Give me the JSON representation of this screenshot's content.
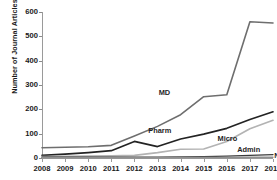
{
  "chart_data": {
    "type": "line",
    "title": "",
    "xlabel": "",
    "ylabel": "Number of Journal Articles",
    "categories": [
      "2008",
      "2009",
      "2010",
      "2011",
      "2012",
      "2013",
      "2014",
      "2015",
      "2016",
      "2017",
      "2018"
    ],
    "x": [
      2008,
      2009,
      2010,
      2011,
      2012,
      2013,
      2014,
      2015,
      2016,
      2017,
      2018
    ],
    "ylim": [
      0,
      600
    ],
    "yticks": [
      0,
      100,
      200,
      300,
      400,
      500,
      600
    ],
    "ytick_labels": [
      "0",
      "100",
      "200",
      "300",
      "400",
      "500",
      "600"
    ],
    "grid": false,
    "legend_position": "inline-labels",
    "series": [
      {
        "name": "MD",
        "color": "#6e6e6e",
        "width": 1.6,
        "values": [
          42,
          44,
          46,
          52,
          90,
          130,
          178,
          252,
          260,
          560,
          555
        ]
      },
      {
        "name": "Pharm",
        "color": "#232323",
        "width": 1.7,
        "values": [
          11,
          16,
          22,
          30,
          68,
          47,
          78,
          98,
          122,
          158,
          190
        ]
      },
      {
        "name": "Micro",
        "color": "#b3b3b3",
        "width": 1.7,
        "values": [
          6,
          7,
          8,
          9,
          11,
          22,
          36,
          37,
          68,
          120,
          155
        ]
      },
      {
        "name": "Admin",
        "color": "#3a3a3a",
        "width": 1.3,
        "values": [
          3,
          3,
          3,
          3,
          4,
          4,
          5,
          6,
          8,
          11,
          14
        ]
      },
      {
        "name": "Nurse",
        "color": "#8f8f8f",
        "width": 1.3,
        "values": [
          1,
          1,
          1,
          1,
          1,
          1,
          2,
          2,
          2,
          3,
          3
        ]
      }
    ],
    "annotations": [
      {
        "text": "MD",
        "x": 2013.05,
        "y": 268
      },
      {
        "text": "Pharm",
        "x": 2012.6,
        "y": 112
      },
      {
        "text": "Micro",
        "x": 2015.6,
        "y": 80
      },
      {
        "text": "Admin",
        "x": 2016.45,
        "y": 32
      },
      {
        "text": "Nurse",
        "x": 2018.05,
        "y": 8
      }
    ]
  }
}
